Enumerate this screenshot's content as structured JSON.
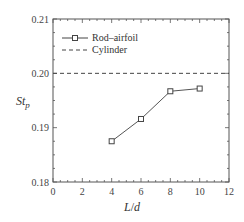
{
  "chart_data": {
    "type": "line",
    "title": "",
    "xlabel": "L/d",
    "ylabel": "St_p",
    "xlim": [
      0,
      12
    ],
    "ylim": [
      0.18,
      0.21
    ],
    "xticks": [
      "0",
      "2",
      "4",
      "6",
      "8",
      "10",
      "12"
    ],
    "yticks": [
      "0.18",
      "0.19",
      "0.20",
      "0.21"
    ],
    "grid": false,
    "legend_position": "upper left",
    "series": [
      {
        "name": "Rod–airfoil",
        "style": "solid line with square markers",
        "x": [
          4,
          6,
          8,
          10
        ],
        "values": [
          0.1875,
          0.1916,
          0.1967,
          0.1972
        ]
      },
      {
        "name": "Cylinder",
        "style": "dashed horizontal line",
        "x": [
          0,
          12
        ],
        "values": [
          0.2,
          0.2
        ]
      }
    ]
  },
  "labels": {
    "xlabel_main": "L",
    "xlabel_sep": "/",
    "xlabel_sub": "d",
    "ylabel_main": "St",
    "ylabel_sub": "p",
    "legend_1": "Rod–airfoil",
    "legend_2": "Cylinder"
  }
}
